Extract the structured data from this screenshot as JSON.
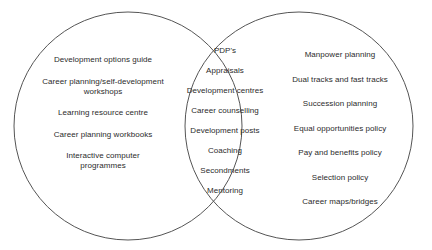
{
  "diagram": {
    "type": "venn",
    "circle_count": 2,
    "stroke_color": "#555555",
    "text_color": "#2b2b2b",
    "background_color": "#ffffff",
    "geometry": {
      "left_circle": {
        "cx": 128,
        "cy": 126,
        "r": 114
      },
      "right_circle": {
        "cx": 299,
        "cy": 126,
        "r": 114
      }
    },
    "left_region": {
      "items": [
        "Development options guide",
        "Career planning/self-development\nworkshops",
        "Learning resource centre",
        "Career planning workbooks",
        "Interactive computer\nprogrammes"
      ]
    },
    "center_region": {
      "items": [
        "PDP's",
        "Appraisals",
        "Development centres",
        "Career counselling",
        "Development posts",
        "Coaching",
        "Secondments",
        "Mentoring"
      ]
    },
    "right_region": {
      "items": [
        "Manpower planning",
        "Dual tracks and fast tracks",
        "Succession planning",
        "Equal opportunities policy",
        "Pay and benefits policy",
        "Selection policy",
        "Career maps/bridges"
      ]
    }
  }
}
